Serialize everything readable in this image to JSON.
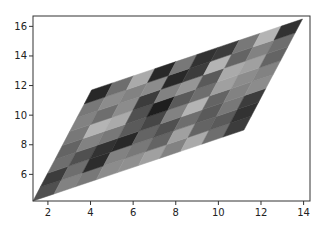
{
  "chart_data": {
    "type": "heatmap",
    "subtype": "pcolormesh-skewed-grid",
    "title": "",
    "xlabel": "",
    "ylabel": "",
    "colormap": "gray",
    "xlim": [
      1.3,
      14.3
    ],
    "ylim": [
      4.2,
      16.7
    ],
    "xticks": [
      2,
      4,
      6,
      8,
      10,
      12,
      14
    ],
    "yticks": [
      6,
      8,
      10,
      12,
      14,
      16
    ],
    "grid": false,
    "legend": null,
    "mesh": {
      "origin": [
        1.3,
        4.2
      ],
      "u_vector": [
        9.9,
        4.8
      ],
      "v_vector": [
        2.75,
        7.5
      ],
      "ncols": 10,
      "nrows": 8
    },
    "values": [
      [
        0.3,
        0.55,
        0.5,
        0.6,
        0.62,
        0.7,
        0.55,
        0.75,
        0.45,
        0.2
      ],
      [
        0.2,
        0.45,
        0.12,
        0.55,
        0.5,
        0.4,
        0.7,
        0.4,
        0.35,
        0.15
      ],
      [
        0.45,
        0.3,
        0.15,
        0.1,
        0.4,
        0.3,
        0.45,
        0.35,
        0.5,
        0.2
      ],
      [
        0.4,
        0.55,
        0.5,
        0.35,
        0.25,
        0.55,
        0.8,
        0.4,
        0.55,
        0.6
      ],
      [
        0.5,
        0.8,
        0.75,
        0.3,
        0.05,
        0.35,
        0.45,
        0.7,
        0.6,
        0.55
      ],
      [
        0.55,
        0.45,
        0.6,
        0.2,
        0.55,
        0.65,
        0.35,
        0.75,
        0.7,
        0.4
      ],
      [
        0.5,
        0.6,
        0.55,
        0.6,
        0.1,
        0.2,
        0.8,
        0.4,
        0.55,
        0.45
      ],
      [
        0.1,
        0.45,
        0.75,
        0.1,
        0.5,
        0.15,
        0.2,
        0.5,
        0.8,
        0.15
      ]
    ]
  },
  "axes": {
    "x_tick_labels": [
      "2",
      "4",
      "6",
      "8",
      "10",
      "12",
      "14"
    ],
    "y_tick_labels": [
      "6",
      "8",
      "10",
      "12",
      "14",
      "16"
    ]
  }
}
